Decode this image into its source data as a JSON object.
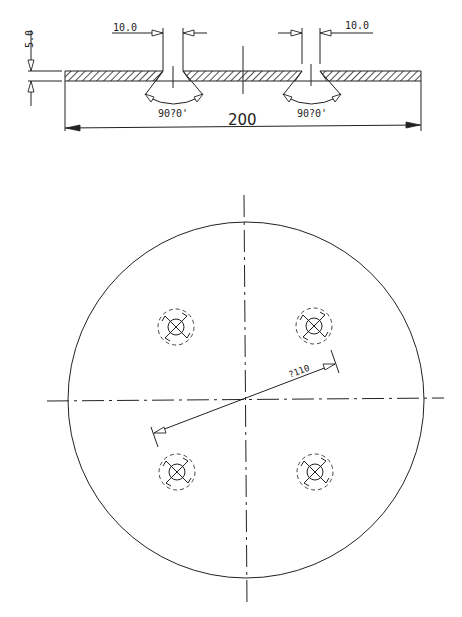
{
  "drawing": {
    "section_view": {
      "thickness_label": "5.0",
      "countersink_width_left": "10.0",
      "countersink_width_right": "10.0",
      "angle_label_left": "90?0'",
      "angle_label_right": "90?0'",
      "overall_length_label": "200"
    },
    "plan_view": {
      "hole_count": 4,
      "pitch_diameter_label": "?110"
    }
  },
  "labels": {
    "thickness": "5.0",
    "width_left": "10.0",
    "width_right": "10.0",
    "angle_left": "90?0'",
    "angle_right": "90?0'",
    "length": "200",
    "pcd": "?110"
  },
  "colors": {
    "line": "#222222",
    "background": "#ffffff"
  }
}
